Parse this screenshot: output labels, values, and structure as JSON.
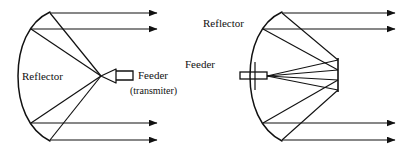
{
  "figure": {
    "background_color": "#ffffff",
    "stroke_color": "#111111",
    "text_color": "#111111",
    "width": 408,
    "height": 152
  },
  "diagrams": [
    {
      "id": "front-fed-parabolic-reflector",
      "name": "Front-fed parabolic reflector antenna",
      "labels": {
        "reflector": "Reflector",
        "feeder": "Feeder",
        "feeder_sub": "(transmiter)"
      },
      "components": [
        "parabolic-reflector",
        "feeder-horn",
        "waveguide",
        "ray-lines",
        "output-beam-arrows"
      ],
      "ray_count": 4,
      "beam_arrow_count": 4
    },
    {
      "id": "cassegrain-reflector",
      "name": "Reflector antenna with sub-reflector",
      "labels": {
        "reflector": "Reflector",
        "feeder": "Feeder"
      },
      "components": [
        "parabolic-reflector",
        "feeder-waveguide",
        "sub-reflector",
        "feed-support",
        "ray-lines",
        "output-beam-arrows"
      ],
      "ray_count": 4,
      "beam_arrow_count": 4
    }
  ],
  "label_positions": {
    "left_reflector": {
      "x": 22,
      "y": 80
    },
    "left_feeder": {
      "x": 134,
      "y": 79
    },
    "left_feeder_sub": {
      "x": 130,
      "y": 94
    },
    "right_reflector": {
      "x": 203,
      "y": 27
    },
    "right_feeder": {
      "x": 185,
      "y": 68
    }
  }
}
